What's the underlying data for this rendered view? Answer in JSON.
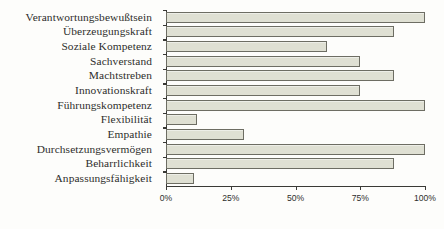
{
  "chart_data": {
    "type": "bar",
    "orientation": "horizontal",
    "title": "",
    "xlabel": "",
    "ylabel": "",
    "xlim": [
      0,
      100
    ],
    "xticks": [
      0,
      25,
      50,
      75,
      100
    ],
    "xtick_labels": [
      "0%",
      "25%",
      "50%",
      "75%",
      "100%"
    ],
    "grid": false,
    "legend": false,
    "categories": [
      "Verantwortungsbewußtsein",
      "Überzeugungskraft",
      "Soziale Kompetenz",
      "Sachverstand",
      "Machtstreben",
      "Innovationskraft",
      "Führungskompetenz",
      "Flexibilität",
      "Empathie",
      "Durchsetzungsvermögen",
      "Beharrlichkeit",
      "Anpassungsfähigkeit"
    ],
    "values": [
      100,
      88,
      62,
      75,
      88,
      75,
      100,
      12,
      30,
      100,
      88,
      11
    ],
    "bar_fill_color": "#dfe0d3",
    "bar_border_color": "#6d6d63",
    "axis_color": "#3a3a36",
    "background_color": "#fdfdfb"
  }
}
